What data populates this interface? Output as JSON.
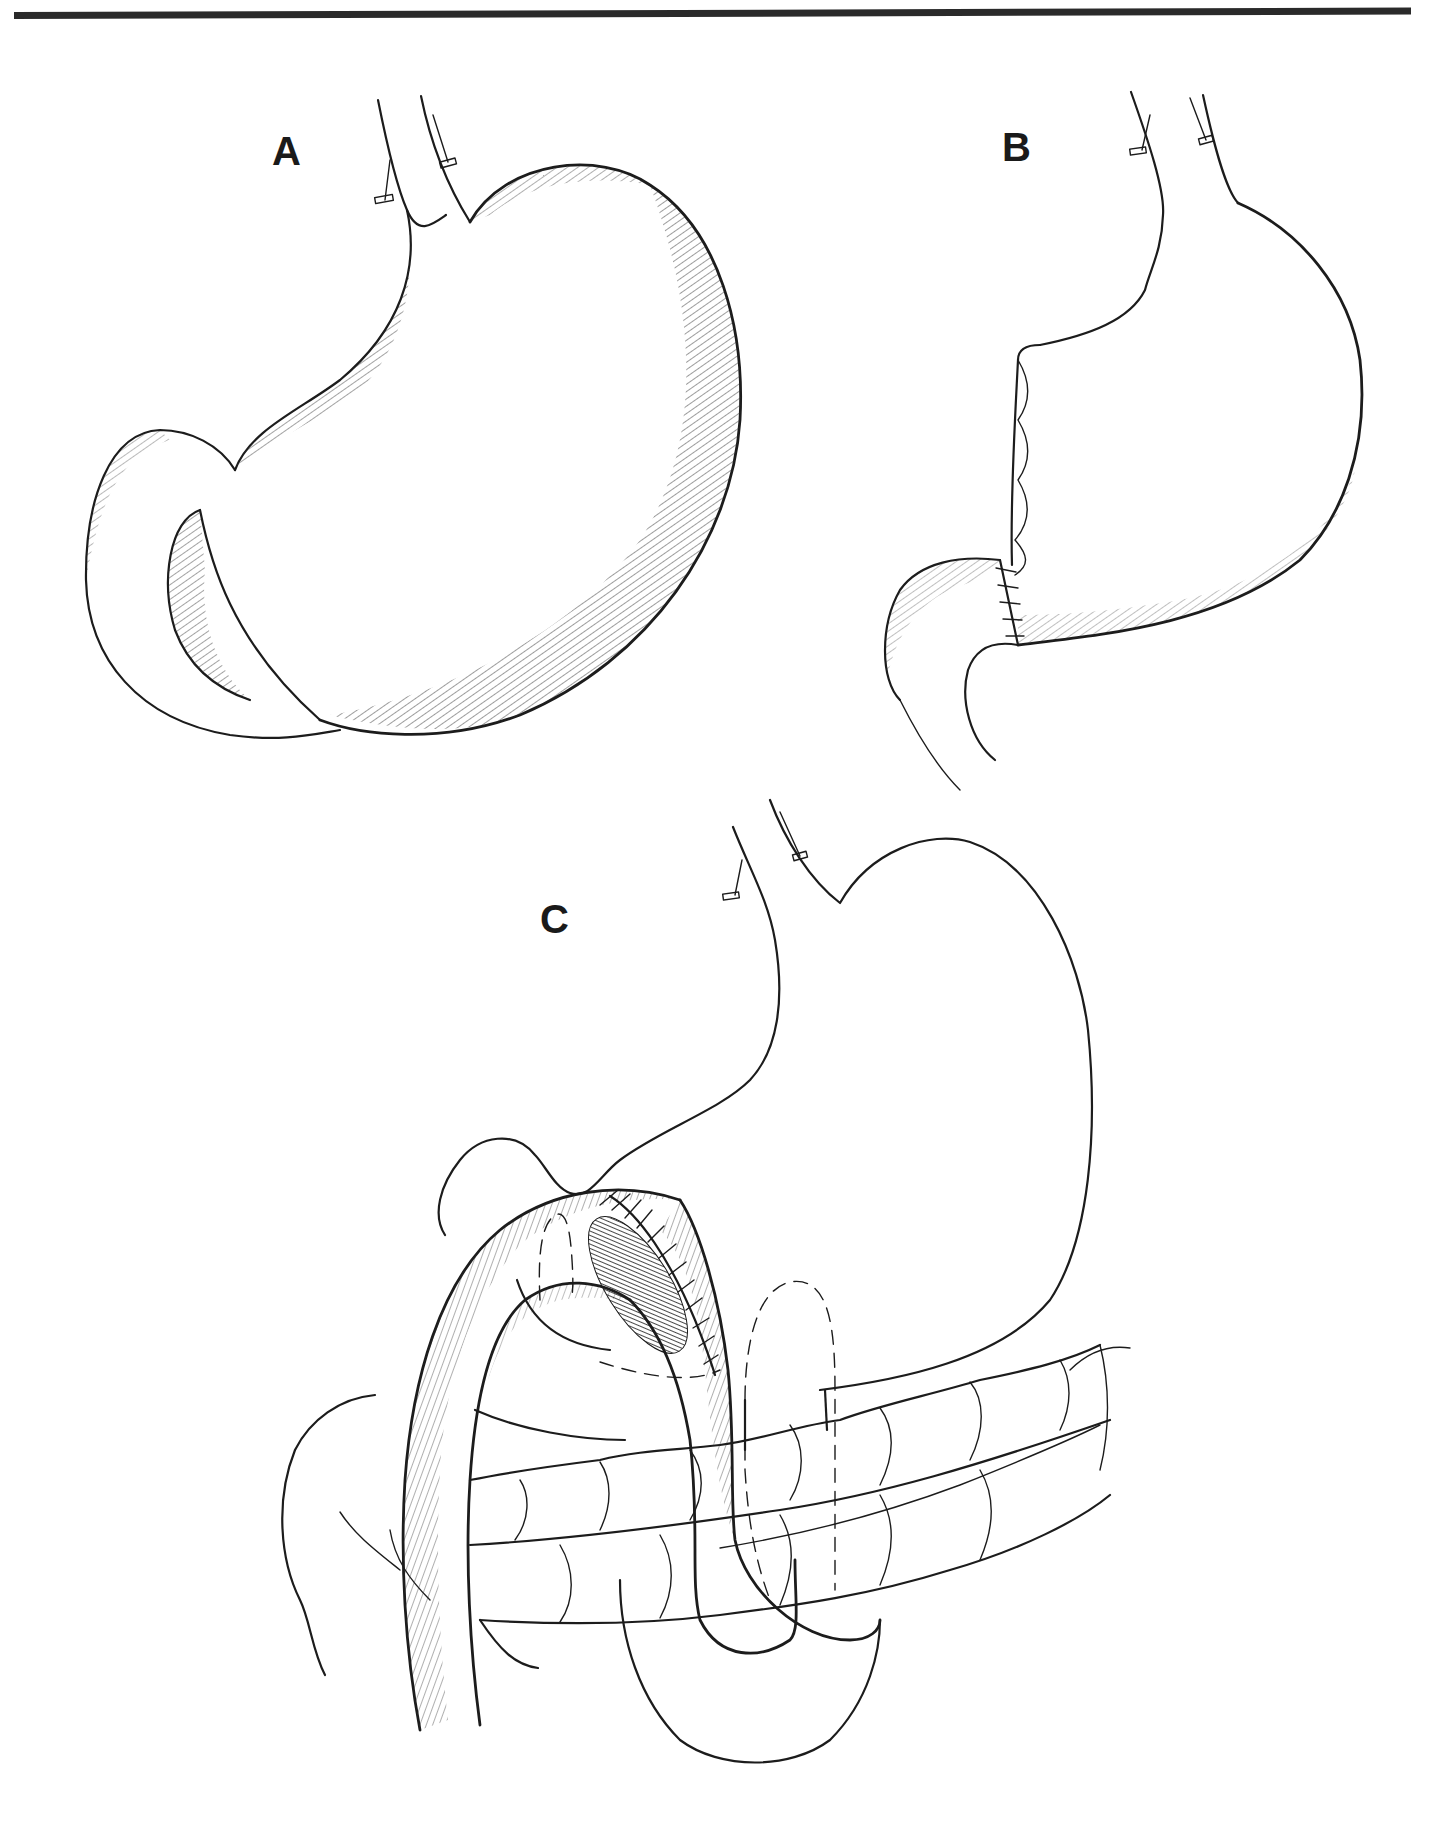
{
  "figure": {
    "top_rule": {
      "color": "#2a2a2a"
    },
    "background": "#ffffff",
    "ink_color": "#1c1c1c",
    "panels": [
      {
        "id": "A",
        "label": "A",
        "description": "Intact stomach with duodenum, esophagus with vagal clips"
      },
      {
        "id": "B",
        "label": "B",
        "description": "Stomach after partial resection with sutured lesser curvature and gastroduodenal anastomosis"
      },
      {
        "id": "C",
        "label": "C",
        "description": "Stomach with gastrojejunal loop anastomosis passing anterior to transverse colon; shaded stoma and dashed retrocolic outline"
      }
    ]
  }
}
